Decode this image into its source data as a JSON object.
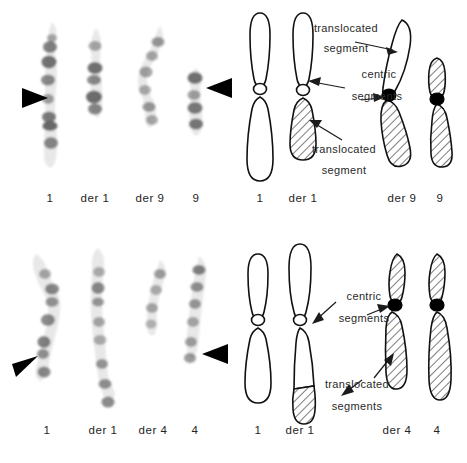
{
  "figure": {
    "panels": [
      {
        "id": "top",
        "type": "photomicrograph",
        "translocation": "t(1;9)",
        "captions": [
          "1",
          "der 1",
          "der 9",
          "9"
        ]
      },
      {
        "id": "top-diagram",
        "type": "ideogram",
        "translocation": "t(1;9)",
        "captions": [
          "1",
          "der 1",
          "der 9",
          "9"
        ],
        "annotations": [
          {
            "line1": "translocated",
            "line2": "segment"
          },
          {
            "line1": "centric",
            "line2": "segments"
          },
          {
            "line1": "translocated",
            "line2": "segment"
          }
        ]
      },
      {
        "id": "bottom",
        "type": "photomicrograph",
        "translocation": "t(1;4)",
        "captions": [
          "1",
          "der 1",
          "der 4",
          "4"
        ]
      },
      {
        "id": "bottom-diagram",
        "type": "ideogram",
        "translocation": "t(1;4)",
        "captions": [
          "1",
          "der 1",
          "der 4",
          "4"
        ],
        "annotations": [
          {
            "line1": "centric",
            "line2": "segments"
          },
          {
            "line1": "translocated",
            "line2": "segments"
          }
        ]
      }
    ],
    "colors": {
      "background": "#ffffff",
      "ink": "#111111",
      "text": "#2a2a2a",
      "centromere_solid": "#000000",
      "band_dark": "#5a5a5a",
      "chromatid_fill": "#e8e8e8"
    }
  }
}
